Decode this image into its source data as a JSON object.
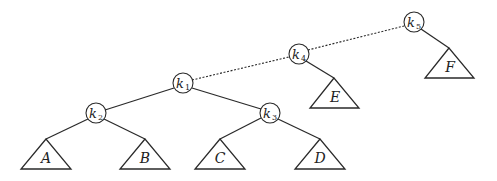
{
  "diagram": {
    "type": "binary-search-tree",
    "nodes": [
      {
        "id": "k1",
        "letter": "k",
        "sub": "1",
        "x": 183,
        "y": 83
      },
      {
        "id": "k2",
        "letter": "k",
        "sub": "2",
        "x": 96,
        "y": 113
      },
      {
        "id": "k3",
        "letter": "k",
        "sub": "3",
        "x": 270,
        "y": 113
      },
      {
        "id": "k4",
        "letter": "k",
        "sub": "4",
        "x": 299,
        "y": 54
      },
      {
        "id": "k5",
        "letter": "k",
        "sub": "5",
        "x": 414,
        "y": 22
      }
    ],
    "subtrees": [
      {
        "id": "A",
        "label": "A",
        "apex_x": 46,
        "apex_y": 139
      },
      {
        "id": "B",
        "label": "B",
        "apex_x": 145,
        "apex_y": 139
      },
      {
        "id": "C",
        "label": "C",
        "apex_x": 220,
        "apex_y": 139
      },
      {
        "id": "D",
        "label": "D",
        "apex_x": 320,
        "apex_y": 139
      },
      {
        "id": "E",
        "label": "E",
        "apex_x": 334,
        "apex_y": 78
      },
      {
        "id": "F",
        "label": "F",
        "apex_x": 449,
        "apex_y": 48
      }
    ],
    "solid_edges": [
      [
        "k1",
        "k2"
      ],
      [
        "k1",
        "k3"
      ],
      [
        "k2",
        "A"
      ],
      [
        "k2",
        "B"
      ],
      [
        "k3",
        "C"
      ],
      [
        "k3",
        "D"
      ],
      [
        "k4",
        "E"
      ],
      [
        "k5",
        "F"
      ]
    ],
    "dotted_edges": [
      [
        "k1",
        "k4"
      ],
      [
        "k4",
        "k5"
      ]
    ]
  }
}
